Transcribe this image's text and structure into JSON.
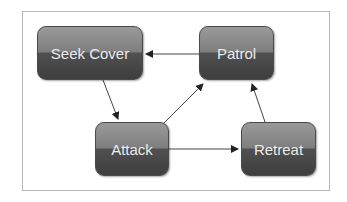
{
  "diagram": {
    "type": "state-machine",
    "nodes": [
      {
        "id": "seek_cover",
        "label": "Seek Cover"
      },
      {
        "id": "patrol",
        "label": "Patrol"
      },
      {
        "id": "attack",
        "label": "Attack"
      },
      {
        "id": "retreat",
        "label": "Retreat"
      }
    ],
    "edges": [
      {
        "from": "patrol",
        "to": "seek_cover"
      },
      {
        "from": "seek_cover",
        "to": "attack"
      },
      {
        "from": "attack",
        "to": "patrol"
      },
      {
        "from": "attack",
        "to": "retreat"
      },
      {
        "from": "retreat",
        "to": "patrol"
      }
    ]
  }
}
